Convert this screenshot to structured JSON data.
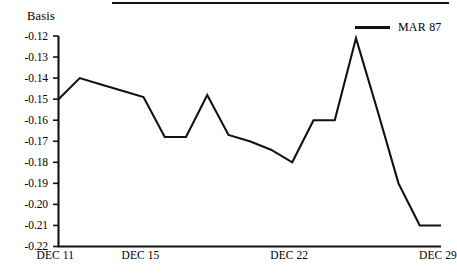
{
  "chart_data": {
    "type": "line",
    "title": "",
    "ylabel": "Basis",
    "xlabel": "",
    "ylim": [
      -0.22,
      -0.12
    ],
    "xlim": [
      0,
      18
    ],
    "grid": false,
    "legend_position": "top-right",
    "y_ticks": [
      "-0.12",
      "-0.13",
      "-0.14",
      "-0.15",
      "-0.16",
      "-0.17",
      "-0.18",
      "-0.19",
      "-0.20",
      "-0.21",
      "-0.22"
    ],
    "y_tick_values": [
      -0.12,
      -0.13,
      -0.14,
      -0.15,
      -0.16,
      -0.17,
      -0.18,
      -0.19,
      -0.2,
      -0.21,
      -0.22
    ],
    "x_ticks": [
      "DEC 11",
      "DEC 15",
      "DEC 22",
      "DEC 29"
    ],
    "x_tick_positions": [
      0,
      4,
      11,
      18
    ],
    "series": [
      {
        "name": "MAR 87",
        "color": "#111111",
        "x": [
          0,
          1,
          2,
          3,
          4,
          5,
          6,
          7,
          8,
          9,
          10,
          11,
          12,
          13,
          14,
          15,
          16,
          17,
          18
        ],
        "values": [
          -0.15,
          -0.14,
          -0.143,
          -0.146,
          -0.149,
          -0.168,
          -0.168,
          -0.148,
          -0.167,
          -0.17,
          -0.174,
          -0.18,
          -0.16,
          -0.16,
          -0.121,
          -0.155,
          -0.19,
          -0.21,
          -0.21
        ]
      }
    ]
  },
  "legend": {
    "entries": [
      {
        "label": "MAR 87"
      }
    ]
  },
  "axes": {
    "y_axis_label": "Basis"
  }
}
